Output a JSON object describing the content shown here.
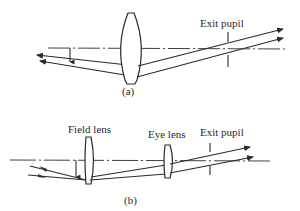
{
  "diagram": {
    "panel_a": {
      "caption": "(a)",
      "exit_pupil_label": "Exit pupil"
    },
    "panel_b": {
      "caption": "(b)",
      "field_lens_label": "Field lens",
      "eye_lens_label": "Eye lens",
      "exit_pupil_label": "Exit pupil"
    },
    "colors": {
      "line": "#2a2a2a",
      "background": "#ffffff"
    }
  }
}
